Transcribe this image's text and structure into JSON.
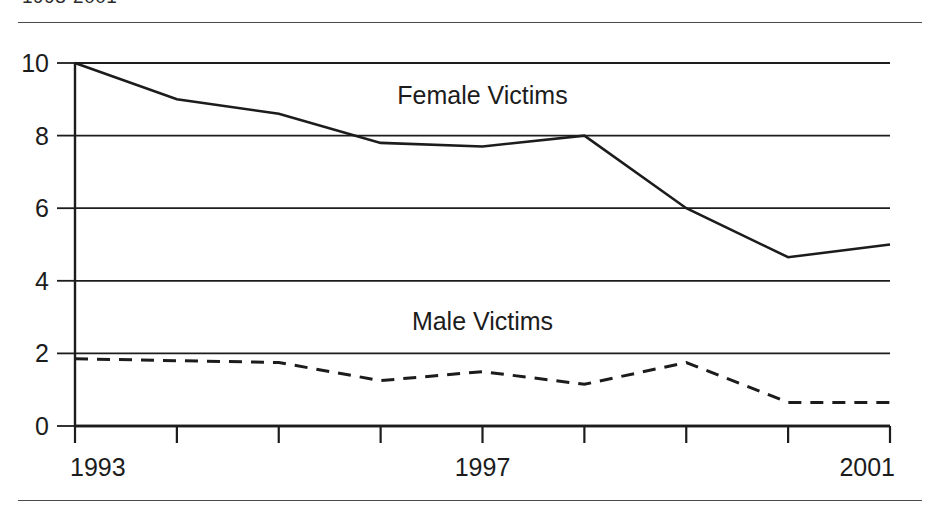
{
  "figure": {
    "title": "1993-2001",
    "top_rule": "horizontal-rule",
    "bottom_rule": "horizontal-rule"
  },
  "chart_data": {
    "type": "line",
    "title": "1993-2001",
    "xlabel": "",
    "ylabel": "",
    "x": [
      1993,
      1994,
      1995,
      1996,
      1997,
      1998,
      1999,
      2000,
      2001
    ],
    "xlim": [
      1993,
      2001
    ],
    "ylim": [
      0,
      10
    ],
    "xtick_values": [
      1993,
      1994,
      1995,
      1996,
      1997,
      1998,
      1999,
      2000,
      2001
    ],
    "xtick_labels": [
      "1993",
      "",
      "",
      "",
      "1997",
      "",
      "",
      "",
      "2001"
    ],
    "ytick_values": [
      0,
      2,
      4,
      6,
      8,
      10
    ],
    "ytick_labels": [
      "0",
      "2",
      "4",
      "6",
      "8",
      "10"
    ],
    "grid": "horizontal",
    "legend_position": "inline-labels",
    "series": [
      {
        "name": "Female Victims",
        "style": "solid",
        "color": "#1c1c1c",
        "values": [
          10.0,
          9.0,
          8.6,
          7.8,
          7.7,
          8.0,
          6.0,
          4.65,
          5.0
        ],
        "label_x": 1997.0,
        "label_y": 9.05
      },
      {
        "name": "Male Victims",
        "style": "dashed",
        "color": "#1c1c1c",
        "values": [
          1.85,
          1.8,
          1.75,
          1.25,
          1.5,
          1.15,
          1.75,
          0.65,
          0.65
        ],
        "label_x": 1997.0,
        "label_y": 2.85
      }
    ]
  },
  "axes": {
    "y_ticks": [
      {
        "label": "10",
        "value": 10
      },
      {
        "label": "8",
        "value": 8
      },
      {
        "label": "6",
        "value": 6
      },
      {
        "label": "4",
        "value": 4
      },
      {
        "label": "2",
        "value": 2
      },
      {
        "label": "0",
        "value": 0
      }
    ],
    "x_ticks": [
      {
        "label": "1993",
        "value": 1993
      },
      {
        "label": "",
        "value": 1994
      },
      {
        "label": "",
        "value": 1995
      },
      {
        "label": "",
        "value": 1996
      },
      {
        "label": "1997",
        "value": 1997
      },
      {
        "label": "",
        "value": 1998
      },
      {
        "label": "",
        "value": 1999
      },
      {
        "label": "",
        "value": 2000
      },
      {
        "label": "2001",
        "value": 2001
      }
    ]
  }
}
